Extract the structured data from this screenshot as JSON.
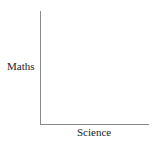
{
  "chart_data": {
    "type": "scatter",
    "title": "",
    "xlabel": "Science",
    "ylabel": "Maths",
    "x": [],
    "y": [],
    "series": [],
    "grid": false,
    "legend": null,
    "axes": {
      "show_ticks": false,
      "show_tick_labels": false,
      "color": "#8a8a8a"
    }
  }
}
